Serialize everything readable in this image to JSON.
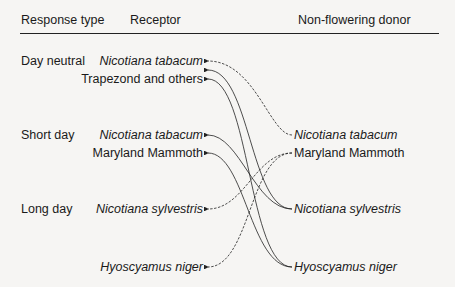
{
  "headers": {
    "response_type": "Response type",
    "receptor": "Receptor",
    "donor": "Non-flowering donor"
  },
  "response_types": [
    {
      "label": "Day neutral"
    },
    {
      "label": "Short day"
    },
    {
      "label": "Long day"
    }
  ],
  "receptors": [
    {
      "label": "Nicotiana tabacum",
      "italic": true,
      "group": "Day neutral"
    },
    {
      "label": "Trapezond and others",
      "italic": false,
      "group": "Day neutral"
    },
    {
      "label": "Nicotiana tabacum",
      "italic": true,
      "group": "Short day"
    },
    {
      "label": "Maryland Mammoth",
      "italic": false,
      "group": "Short day"
    },
    {
      "label": "Nicotiana sylvestris",
      "italic": true,
      "group": "Long day"
    },
    {
      "label": "Hyoscyamus niger",
      "italic": true,
      "group": "Long day"
    }
  ],
  "donors": [
    {
      "label": "Nicotiana tabacum",
      "italic": true
    },
    {
      "label": "Maryland Mammoth",
      "italic": false
    },
    {
      "label": "Nicotiana sylvestris",
      "italic": true
    },
    {
      "label": "Hyoscyamus niger",
      "italic": true
    }
  ],
  "connections": [
    {
      "from": "Nicotiana tabacum (donor)",
      "to": "Nicotiana tabacum (day neutral)",
      "style": "dashed"
    },
    {
      "from": "Nicotiana sylvestris (donor)",
      "to": "Day neutral receptor",
      "style": "solid"
    },
    {
      "from": "Hyoscyamus niger (donor)",
      "to": "Trapezond and others",
      "style": "solid"
    },
    {
      "from": "Nicotiana sylvestris (donor)",
      "to": "Nicotiana tabacum (short day)",
      "style": "solid"
    },
    {
      "from": "Hyoscyamus niger (donor)",
      "to": "Maryland Mammoth (short day)",
      "style": "solid"
    },
    {
      "from": "Maryland Mammoth (donor)",
      "to": "Nicotiana sylvestris (long day)",
      "style": "dashed"
    },
    {
      "from": "Maryland Mammoth (donor)",
      "to": "Hyoscyamus niger (long day)",
      "style": "dashed"
    }
  ]
}
